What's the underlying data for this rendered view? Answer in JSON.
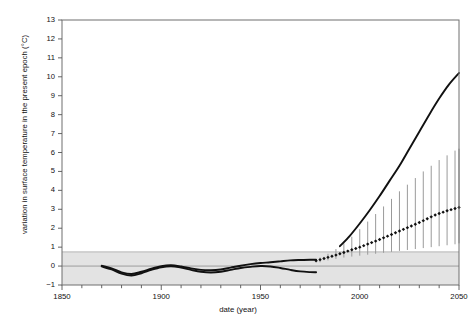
{
  "chart_data": {
    "type": "line",
    "title": "",
    "xlabel": "date (year)",
    "ylabel": "variation in surface temperature in the present epoch (°C)",
    "xlim": [
      1850,
      2050
    ],
    "ylim": [
      -1,
      13
    ],
    "grid": false,
    "legend_position": "none",
    "x_major_ticks": [
      1850,
      1900,
      1950,
      2000,
      2050
    ],
    "x_tick_labels": [
      "1850",
      "1900",
      "1950",
      "2000",
      "2050"
    ],
    "x_minor_tick_step": 10,
    "y_ticks": [
      -1,
      0,
      1,
      2,
      3,
      4,
      5,
      6,
      7,
      8,
      9,
      10,
      11,
      12,
      13
    ],
    "y_tick_labels": [
      "−1",
      "0",
      "1",
      "2",
      "3",
      "4",
      "5",
      "6",
      "7",
      "8",
      "9",
      "10",
      "11",
      "12",
      "13"
    ],
    "shaded_band": {
      "name": "natural-variability-band",
      "y_from": -1,
      "y_to": 0.75,
      "color": "#e3e3e3"
    },
    "zero_line": {
      "y": 0,
      "color": "#8a8a8a"
    },
    "series": [
      {
        "name": "observed record (upper trace)",
        "style": "solid-thick",
        "color": "#111111",
        "x": [
          1870,
          1875,
          1880,
          1885,
          1890,
          1895,
          1900,
          1905,
          1910,
          1915,
          1920,
          1925,
          1930,
          1935,
          1940,
          1945,
          1950,
          1955,
          1960,
          1965,
          1970,
          1975,
          1978
        ],
        "values": [
          0.02,
          -0.12,
          -0.33,
          -0.42,
          -0.3,
          -0.14,
          0.0,
          0.05,
          -0.02,
          -0.12,
          -0.2,
          -0.22,
          -0.18,
          -0.08,
          0.02,
          0.1,
          0.16,
          0.2,
          0.25,
          0.3,
          0.32,
          0.33,
          0.33
        ]
      },
      {
        "name": "observed record (lower trace)",
        "style": "solid-thick",
        "color": "#111111",
        "x": [
          1870,
          1875,
          1880,
          1885,
          1890,
          1895,
          1900,
          1905,
          1910,
          1915,
          1920,
          1925,
          1930,
          1935,
          1940,
          1945,
          1950,
          1955,
          1960,
          1965,
          1970,
          1975,
          1978
        ],
        "values": [
          -0.02,
          -0.18,
          -0.4,
          -0.5,
          -0.38,
          -0.2,
          -0.06,
          -0.01,
          -0.08,
          -0.2,
          -0.3,
          -0.34,
          -0.3,
          -0.2,
          -0.1,
          -0.04,
          0.0,
          -0.02,
          -0.1,
          -0.2,
          -0.28,
          -0.32,
          -0.33
        ]
      },
      {
        "name": "projection central estimate",
        "style": "dotted-diamond",
        "color": "#111111",
        "x": [
          1978,
          1980,
          1982,
          1984,
          1986,
          1988,
          1990,
          1992,
          1994,
          1996,
          1998,
          2000,
          2002,
          2004,
          2006,
          2008,
          2010,
          2012,
          2014,
          2016,
          2018,
          2020,
          2022,
          2024,
          2026,
          2028,
          2030,
          2032,
          2034,
          2036,
          2038,
          2040,
          2042,
          2044,
          2046,
          2048,
          2050
        ],
        "values": [
          0.28,
          0.34,
          0.4,
          0.46,
          0.52,
          0.58,
          0.65,
          0.72,
          0.79,
          0.86,
          0.93,
          1.0,
          1.08,
          1.16,
          1.24,
          1.32,
          1.4,
          1.49,
          1.58,
          1.67,
          1.76,
          1.85,
          1.94,
          2.03,
          2.12,
          2.21,
          2.3,
          2.4,
          2.5,
          2.6,
          2.7,
          2.78,
          2.85,
          2.92,
          2.98,
          3.04,
          3.1
        ]
      },
      {
        "name": "upper projection envelope curve",
        "style": "solid-thick",
        "color": "#111111",
        "x": [
          1990,
          1995,
          2000,
          2005,
          2010,
          2015,
          2020,
          2025,
          2030,
          2035,
          2040,
          2045,
          2050
        ],
        "values": [
          1.05,
          1.6,
          2.25,
          2.95,
          3.7,
          4.5,
          5.3,
          6.2,
          7.1,
          8.0,
          8.85,
          9.6,
          10.2
        ]
      }
    ],
    "error_bars": {
      "name": "projection uncertainty range",
      "color": "#9a9a9a",
      "x": [
        1980,
        1984,
        1988,
        1992,
        1996,
        2000,
        2004,
        2008,
        2012,
        2016,
        2020,
        2024,
        2028,
        2032,
        2036,
        2040,
        2044,
        2048,
        2050
      ],
      "lower": [
        0.2,
        0.3,
        0.38,
        0.45,
        0.5,
        0.55,
        0.6,
        0.65,
        0.7,
        0.75,
        0.8,
        0.85,
        0.9,
        0.95,
        1.0,
        1.05,
        1.1,
        1.15,
        1.2
      ],
      "upper": [
        0.45,
        0.65,
        0.9,
        1.2,
        1.55,
        1.95,
        2.35,
        2.75,
        3.15,
        3.55,
        3.95,
        4.3,
        4.65,
        5.0,
        5.3,
        5.6,
        5.85,
        6.1,
        6.2
      ]
    }
  }
}
